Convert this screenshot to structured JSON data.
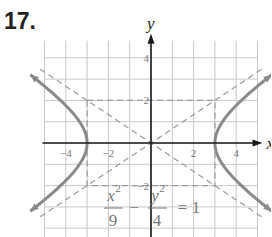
{
  "problem_number": "17.",
  "chart_data": {
    "type": "line",
    "title": "",
    "equation": "x^2/9 - y^2/4 = 1",
    "equation_parts": {
      "num1": "x",
      "den1": "9",
      "num2": "y",
      "den2": "4",
      "rhs": "= 1",
      "minus": "−",
      "exp": "2"
    },
    "xlabel": "x",
    "ylabel": "y",
    "xlim": [
      -5,
      5
    ],
    "ylim": [
      -4.5,
      4.8
    ],
    "x_ticks": [
      -4,
      -2,
      2,
      4
    ],
    "y_ticks": [
      4,
      2,
      -2
    ],
    "x_tick_labels": [
      "−4",
      "−2",
      "2",
      "4"
    ],
    "y_tick_labels": [
      "4",
      "2",
      "−2"
    ],
    "grid": true,
    "series": [
      {
        "name": "hyperbola right branch",
        "style": "solid",
        "vertex": [
          3,
          0
        ]
      },
      {
        "name": "hyperbola left branch",
        "style": "solid",
        "vertex": [
          -3,
          0
        ]
      },
      {
        "name": "asymptote y=2x/3",
        "style": "dashed"
      },
      {
        "name": "asymptote y=-2x/3",
        "style": "dashed"
      },
      {
        "name": "fundamental rectangle",
        "style": "dashed",
        "corners": [
          [
            -3,
            2
          ],
          [
            3,
            2
          ],
          [
            3,
            -2
          ],
          [
            -3,
            -2
          ]
        ]
      }
    ],
    "colors": {
      "curve": "#8a8a8a",
      "axis": "#1a1a1a",
      "grid": "#c8c8c8",
      "dash": "#9a9a9a",
      "label": "#777777"
    }
  }
}
